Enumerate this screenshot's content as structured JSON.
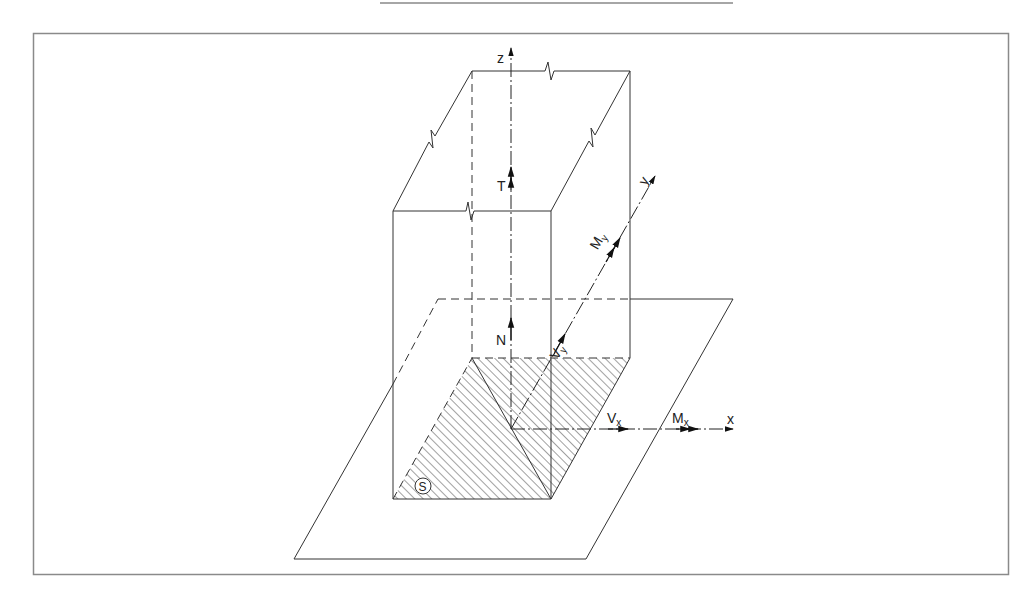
{
  "figure": {
    "top_rule": true,
    "frame": true,
    "colors": {
      "line": "#333333",
      "frame": "#8a8a8a",
      "hatch": "#444444"
    }
  },
  "axes": {
    "z": "z",
    "y": "y",
    "x": "x"
  },
  "forces": {
    "torsion": "T",
    "normal": "N",
    "shear_y": "V",
    "shear_y_sub": "y",
    "shear_x": "V",
    "shear_x_sub": "x",
    "moment_y": "M",
    "moment_y_sub": "y",
    "moment_x": "M",
    "moment_x_sub": "x"
  },
  "section": {
    "label": "S"
  }
}
